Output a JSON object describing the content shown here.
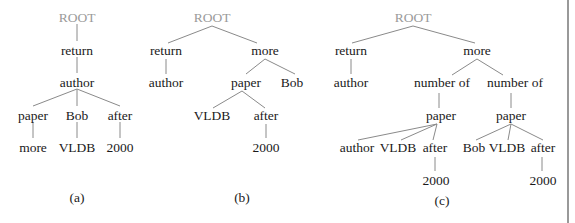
{
  "figure": {
    "trees": [
      {
        "caption": "(a)",
        "nodes": {
          "root": "ROOT",
          "return": "return",
          "author": "author",
          "paper": "paper",
          "bob": "Bob",
          "after": "after",
          "more": "more",
          "vldb": "VLDB",
          "year": "2000"
        }
      },
      {
        "caption": "(b)",
        "nodes": {
          "root": "ROOT",
          "return": "return",
          "more": "more",
          "author": "author",
          "paper": "paper",
          "bob": "Bob",
          "vldb": "VLDB",
          "after": "after",
          "year": "2000"
        }
      },
      {
        "caption": "(c)",
        "nodes": {
          "root": "ROOT",
          "return": "return",
          "more": "more",
          "author": "author",
          "number_of_1": "number of",
          "number_of_2": "number of",
          "paper_1": "paper",
          "paper_2": "paper",
          "author_2": "author",
          "vldb_1": "VLDB",
          "after_1": "after",
          "bob": "Bob",
          "vldb_2": "VLDB",
          "after_2": "after",
          "year_1": "2000",
          "year_2": "2000"
        }
      }
    ]
  }
}
